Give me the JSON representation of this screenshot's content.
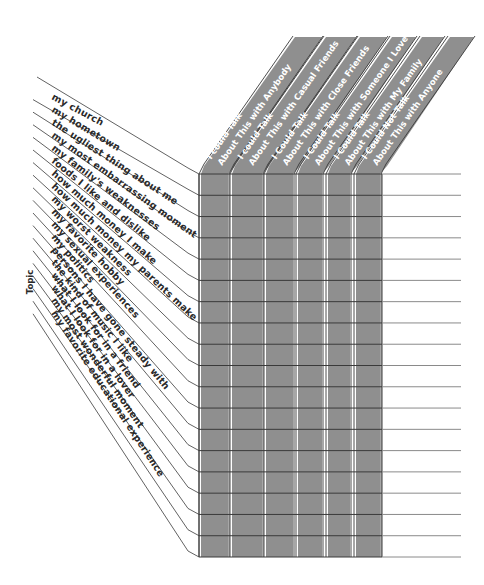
{
  "worksheet": {
    "axis_label": "Topic",
    "columns": [
      {
        "line1": "I could Talk",
        "line2": "About This with Anybody"
      },
      {
        "line1": "I could Talk",
        "line2": "About This with Casual Friends"
      },
      {
        "line1": "I Could Talk",
        "line2": "About This with Close Friends"
      },
      {
        "line1": "I Could Talk",
        "line2": "About This with Someone I Love"
      },
      {
        "line1": "I Could Talk",
        "line2": "About This with My Family"
      },
      {
        "line1": "I Could Not Talk",
        "line2": "About This with Anyone"
      }
    ],
    "topics": [
      "my church",
      "my hometown",
      "the ugliest thing about me",
      "my most embarrassing moment",
      "my family's weaknesses",
      "foods I like and dislike",
      "how much money I make",
      "how much money my parents make",
      "my worst weakness",
      "my favorite hobby",
      "my sexual experiences",
      "my politics",
      "persons I have gone steady with",
      "the kind of music I like",
      "what I look for in a friend",
      "what I look for in a lover",
      "my most wonderful moment",
      "my favorite educational experience"
    ],
    "colors": {
      "column_fill": "#8f8f8f",
      "line": "#3a3a3a",
      "row_line_light": "#8a8a8a",
      "background": "#ffffff"
    }
  }
}
